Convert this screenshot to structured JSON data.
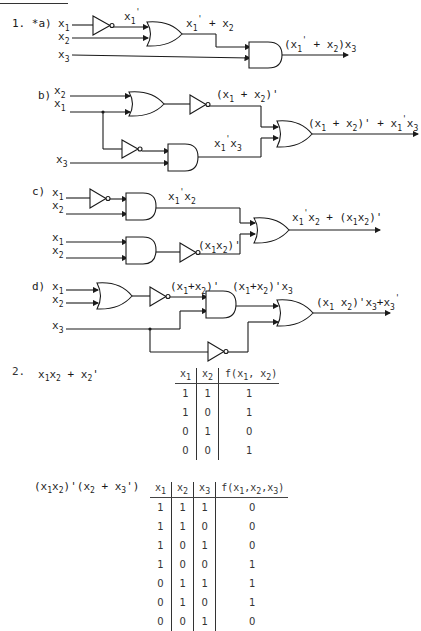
{
  "problem1": {
    "number": "1.",
    "parts": [
      {
        "label": "*a)",
        "inputs": [
          "x1",
          "x2",
          "x3"
        ],
        "intermediate": [
          "x1'",
          "x1' + x2"
        ],
        "output": "(x1' + x2)x3"
      },
      {
        "label": "b)",
        "inputs": [
          "x2",
          "x1",
          "x3"
        ],
        "intermediate": [
          "(x1 + x2)'",
          "x1'x3"
        ],
        "output": "(x1 + x2)' + x1'x3"
      },
      {
        "label": "c)",
        "inputs": [
          "x1",
          "x2",
          "x1",
          "x2"
        ],
        "intermediate": [
          "x1'x2",
          "(x1x2)'"
        ],
        "output": "x1'x2 + (x1x2)'"
      },
      {
        "label": "d)",
        "inputs": [
          "x1",
          "x2",
          "x3"
        ],
        "intermediate": [
          "(x1 + x2)'",
          "(x1 + x2)'x3"
        ],
        "output": "(x1 x2)'x3 + x3'"
      }
    ]
  },
  "problem2": {
    "number": "2.",
    "expr1": "x1x2 + x2'",
    "table1": {
      "headers": [
        "x1",
        "x2",
        "f(x1, x2)"
      ],
      "rows": [
        [
          "1",
          "1",
          "1"
        ],
        [
          "1",
          "0",
          "1"
        ],
        [
          "0",
          "1",
          "0"
        ],
        [
          "0",
          "0",
          "1"
        ]
      ]
    },
    "expr2": "(x1x2)'(x2 + x3')",
    "table2": {
      "headers": [
        "x1",
        "x2",
        "x3",
        "f(x1,x2,x3)"
      ],
      "rows": [
        [
          "1",
          "1",
          "1",
          "0"
        ],
        [
          "1",
          "1",
          "0",
          "0"
        ],
        [
          "1",
          "0",
          "1",
          "0"
        ],
        [
          "1",
          "0",
          "0",
          "1"
        ],
        [
          "0",
          "1",
          "1",
          "1"
        ],
        [
          "0",
          "1",
          "0",
          "1"
        ],
        [
          "0",
          "0",
          "1",
          "0"
        ]
      ]
    }
  }
}
